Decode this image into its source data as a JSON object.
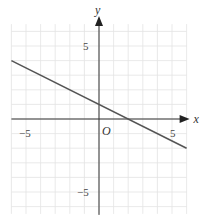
{
  "chart_data": {
    "type": "line",
    "title": "",
    "xlabel": "x",
    "ylabel": "y",
    "origin_label": "O",
    "xlim": [
      -6,
      6
    ],
    "ylim": [
      -6.5,
      6.5
    ],
    "grid": true,
    "grid_step": 1,
    "x_ticks_labeled": [
      -5,
      5
    ],
    "y_ticks_labeled": [
      5,
      -5
    ],
    "tick_labels": {
      "x_neg": "−5",
      "x_pos": "5",
      "y_pos": "5",
      "y_neg": "−5"
    },
    "series": [
      {
        "name": "line",
        "equation": "y = -0.5x + 1",
        "x": [
          -6,
          6
        ],
        "y": [
          4,
          -2
        ],
        "y_intercept": 1,
        "x_intercept": 2
      }
    ]
  }
}
